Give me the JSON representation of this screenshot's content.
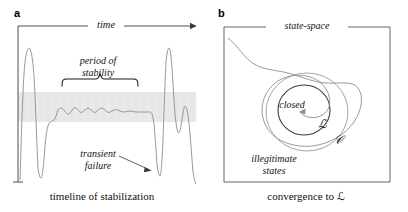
{
  "figure": {
    "width": 408,
    "height": 212,
    "background": "#ffffff",
    "stroke_color": "#8c8c8c",
    "axis_color": "#3a3a3a",
    "band_color": "#e9e9e9",
    "text_color": "#141414"
  },
  "panel_a": {
    "letter": "a",
    "axis_label_time": "time",
    "brace_label": "period of\nstability",
    "brace_label_line1": "period of",
    "brace_label_line2": "stability",
    "annotation_line1": "transient",
    "annotation_line2": "failure",
    "caption": "timeline of stabilization"
  },
  "panel_b": {
    "letter": "b",
    "box_label": "state-space",
    "inner_label": "closed",
    "legitimate_set_symbol": "ℒ",
    "closure_set_symbol": "𝒞",
    "outside_label_line1": "illegitimate",
    "outside_label_line2": "states",
    "caption_prefix": "convergence to ",
    "caption_symbol": "ℒ",
    "caption": "convergence to ℒ"
  }
}
